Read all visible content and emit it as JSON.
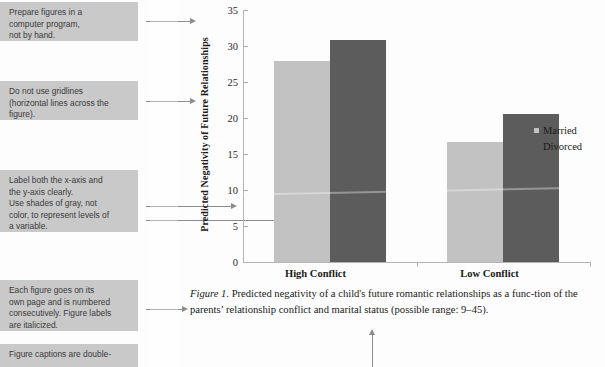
{
  "annotations": [
    {
      "id": "prepare-figures",
      "text": "Prepare figures in a\ncomputer program,\nnot by hand."
    },
    {
      "id": "no-gridlines",
      "text": "Do not use gridlines\n(horizontal lines across the\nfigure)."
    },
    {
      "id": "label-axes",
      "text": "Label both the x-axis and\nthe y-axis clearly.\nUse shades of gray, not\ncolor, to represent levels of\na variable."
    },
    {
      "id": "figure-numbering",
      "text": "Each figure goes on its\nown page and is numbered\nconsecutively. Figure labels\nare italicized."
    },
    {
      "id": "double-spaced-captions",
      "text": "Figure captions are double-"
    }
  ],
  "chart_data": {
    "type": "bar",
    "title": "",
    "xlabel": "",
    "ylabel": "Predicted Negativity of Future Relationships",
    "categories": [
      "High Conflict",
      "Low Conflict"
    ],
    "series": [
      {
        "name": "Married",
        "values": [
          27.9,
          16.7
        ],
        "color": "#c2c2c2"
      },
      {
        "name": "Divorced",
        "values": [
          30.8,
          20.6
        ],
        "color": "#5c5c5c"
      }
    ],
    "ylim": [
      0,
      35
    ],
    "yticks": [
      0,
      5,
      10,
      15,
      20,
      25,
      30,
      35
    ],
    "grid": false,
    "legend_position": "right"
  },
  "caption": {
    "label": "Figure 1.",
    "line1": " Predicted negativity of a child's future romantic relationships as a func-",
    "line2": "tion of the parents’ relationship conflict and marital status (possible range: 9–45)."
  }
}
